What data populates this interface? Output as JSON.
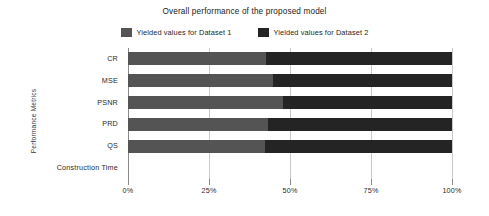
{
  "chart_data": {
    "type": "bar",
    "orientation": "horizontal",
    "stacked": true,
    "normalized_percent": true,
    "title": "Overall performance of the proposed model",
    "xlabel": "",
    "ylabel": "Performance Metrics",
    "categories": [
      "CR",
      "MSE",
      "PSNR",
      "PRD",
      "QS",
      "Construction Time"
    ],
    "series": [
      {
        "name": "Yielded values for Dataset 1",
        "color": "#545454",
        "values": [
          42.6,
          44.8,
          47.8,
          43.2,
          42.3,
          0
        ]
      },
      {
        "name": "Yielded values for Dataset 2",
        "color": "#242424",
        "values": [
          57.4,
          55.2,
          52.2,
          56.8,
          57.7,
          0
        ]
      }
    ],
    "xticks": [
      "0%",
      "25%",
      "50%",
      "75%",
      "100%"
    ],
    "xtick_values": [
      0,
      25,
      50,
      75,
      100
    ],
    "xlim": [
      0,
      100
    ],
    "grid": true,
    "legend_position": "top-center"
  },
  "colors": {
    "background": "#ffffff",
    "dataset1": "#545454",
    "dataset2": "#242424",
    "gridline": "#c9c9c9",
    "axis": "#8a8a8a",
    "text": "#2a2a2a"
  }
}
